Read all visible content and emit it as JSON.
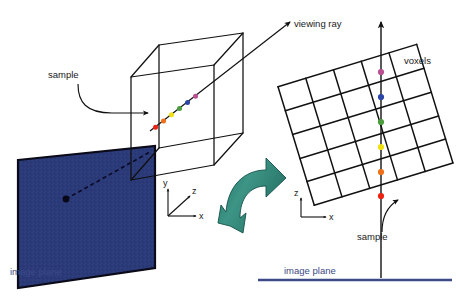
{
  "figure": {
    "background_color": "#ffffff"
  },
  "labels": {
    "sample_left": "sample",
    "sample_right": "sample",
    "viewing_ray": "viewing ray",
    "voxels": "voxels",
    "image_plane_left": "image plane",
    "image_plane_right": "image plane"
  },
  "axes_left": {
    "y": "y",
    "z": "z",
    "x": "x"
  },
  "axes_right": {
    "z": "z",
    "x": "x"
  },
  "colors": {
    "image_plane_fill": "#2b3a79",
    "image_plane_text": "#3c4a86",
    "image_plane_rule": "#3c4a86",
    "transition_arrow": "#2e8376",
    "transition_arrow_dark": "#1d6a5e",
    "outline": "#101010",
    "sample_magenta": "#b9508f",
    "sample_blue": "#2b45a8",
    "sample_green": "#4a9c3c",
    "sample_yellow": "#efe010",
    "sample_orange": "#f0701a",
    "sample_red": "#ee2211"
  },
  "samples_left": [
    {
      "name": "sample-red",
      "color": "#ee2211"
    },
    {
      "name": "sample-orange",
      "color": "#f0701a"
    },
    {
      "name": "sample-yellow",
      "color": "#efe010"
    },
    {
      "name": "sample-green",
      "color": "#4a9c3c"
    },
    {
      "name": "sample-blue",
      "color": "#2b45a8"
    },
    {
      "name": "sample-magenta",
      "color": "#b9508f"
    }
  ],
  "samples_right": [
    {
      "name": "sample-magenta",
      "color": "#b9508f"
    },
    {
      "name": "sample-blue",
      "color": "#2b45a8"
    },
    {
      "name": "sample-green",
      "color": "#4a9c3c"
    },
    {
      "name": "sample-yellow",
      "color": "#efe010"
    },
    {
      "name": "sample-orange",
      "color": "#f0701a"
    },
    {
      "name": "sample-red",
      "color": "#ee2211"
    }
  ],
  "voxel_grid": {
    "columns": 5,
    "rows": 5,
    "rotation_deg": -17
  }
}
